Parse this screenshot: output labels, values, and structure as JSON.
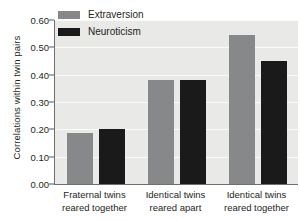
{
  "chart_data": {
    "type": "bar",
    "title": "",
    "xlabel": "",
    "ylabel": "Correlations within twin pairs",
    "ylim": [
      0.0,
      0.6
    ],
    "ytick_labels": [
      "0.00",
      "0.10",
      "0.20",
      "0.30",
      "0.40",
      "0.50",
      "0.60"
    ],
    "ytick_values": [
      0.0,
      0.1,
      0.2,
      0.3,
      0.4,
      0.5,
      0.6
    ],
    "grid": true,
    "legend_position": "top-left-inside",
    "categories": [
      "Fraternal twins reared together",
      "Identical twins reared apart",
      "Identical twins reared together"
    ],
    "category_lines": [
      [
        "Fraternal twins",
        "reared together"
      ],
      [
        "Identical twins",
        "reared apart"
      ],
      [
        "Identical twins",
        "reared together"
      ]
    ],
    "series": [
      {
        "name": "Extraversion",
        "color": "#87888a",
        "values": [
          0.185,
          0.38,
          0.545
        ]
      },
      {
        "name": "Neuroticism",
        "color": "#1a1a1a",
        "values": [
          0.2,
          0.38,
          0.45
        ]
      }
    ]
  },
  "legend": {
    "items": [
      {
        "label": "Extraversion",
        "swatch": "legend-swatch-extraversion"
      },
      {
        "label": "Neuroticism",
        "swatch": "legend-swatch-neuroticism"
      }
    ]
  },
  "colors": {
    "extraversion": "#87888a",
    "neuroticism": "#1a1a1a",
    "plot_background": "#e9e9e7",
    "gridline": "#fafaf8",
    "axis": "#6d6e70",
    "text": "#231f20"
  }
}
